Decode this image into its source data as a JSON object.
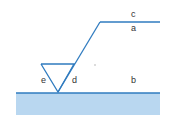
{
  "diagram": {
    "type": "welding-symbol",
    "labels": {
      "c": "c",
      "a": "a",
      "b": "b",
      "d": "d",
      "e": "e"
    },
    "colors": {
      "line": "#2f7bbf",
      "fill": "#b9d7f0",
      "text": "#333333"
    }
  }
}
